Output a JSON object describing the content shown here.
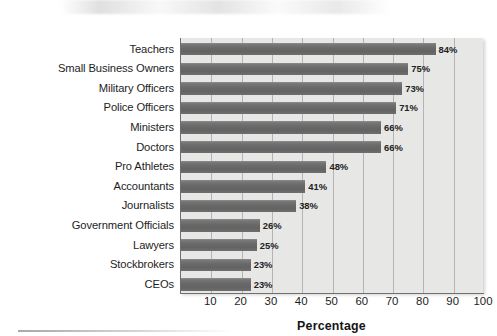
{
  "chart_data": {
    "type": "bar",
    "orientation": "horizontal",
    "title": "",
    "subtitle": "",
    "xlabel": "Percentage",
    "ylabel": "",
    "categories": [
      "Teachers",
      "Small Business Owners",
      "Military Officers",
      "Police Officers",
      "Ministers",
      "Doctors",
      "Pro Athletes",
      "Accountants",
      "Journalists",
      "Government Officials",
      "Lawyers",
      "Stockbrokers",
      "CEOs"
    ],
    "values": [
      84,
      75,
      73,
      71,
      66,
      66,
      48,
      41,
      38,
      26,
      25,
      23,
      23
    ],
    "value_labels": [
      "84%",
      "75%",
      "73%",
      "71%",
      "66%",
      "66%",
      "48%",
      "41%",
      "38%",
      "26%",
      "25%",
      "23%",
      "23%"
    ],
    "xlim": [
      0,
      100
    ],
    "xticks": [
      10,
      20,
      30,
      40,
      50,
      60,
      70,
      80,
      90,
      100
    ],
    "xtick_labels": [
      "10",
      "20",
      "30",
      "40",
      "50",
      "60",
      "70",
      "80",
      "90",
      "100"
    ],
    "grid": true,
    "grid_axis": "x",
    "legend": false,
    "legend_position": "none",
    "bar_color": "#6a6a6a",
    "plot_background": "#e7e7e6",
    "page_background": "#ffffff",
    "gridline_color": "#828282",
    "axis_color": "#6f6f6f",
    "text_color": "#1d1d1d"
  }
}
